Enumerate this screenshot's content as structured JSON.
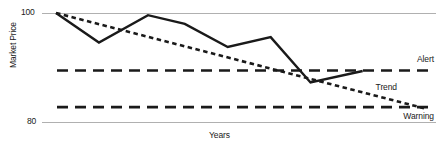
{
  "chart_data": {
    "type": "line",
    "title": "",
    "xlabel": "Years",
    "ylabel": "Market Price",
    "ylim": [
      80,
      100
    ],
    "xlim": [
      0,
      12
    ],
    "yticks": [
      80,
      100
    ],
    "ytick_labels": [
      "80",
      "100"
    ],
    "grid": "horizontal-baselines-only",
    "legend": "inline-right-labels",
    "series": [
      {
        "name": "Market Price",
        "style": "solid",
        "color": "#1a1a1a",
        "x": [
          0,
          1.4,
          3.0,
          4.2,
          5.6,
          7.0,
          8.3,
          10.0
        ],
        "values": [
          100.0,
          94.6,
          99.6,
          98.0,
          93.8,
          95.6,
          87.3,
          89.4
        ]
      },
      {
        "name": "Trend",
        "style": "dotted",
        "color": "#1a1a1a",
        "x": [
          0,
          12
        ],
        "values": [
          100.0,
          82.6
        ]
      },
      {
        "name": "Alert",
        "style": "dashed",
        "color": "#1a1a1a",
        "type": "horizontal-threshold",
        "value": 89.5
      },
      {
        "name": "Warning",
        "style": "dashed",
        "color": "#1a1a1a",
        "type": "horizontal-threshold",
        "value": 82.8
      }
    ],
    "annotations": [
      {
        "text": "Alert",
        "series": "Alert",
        "position": "right-above"
      },
      {
        "text": "Trend",
        "series": "Trend",
        "position": "right-above"
      },
      {
        "text": "Warning",
        "series": "Warning",
        "position": "right-below"
      }
    ]
  },
  "axes": {
    "ylabel": "Market Price",
    "xlabel": "Years",
    "tick_top": "100",
    "tick_bottom": "80"
  },
  "labels": {
    "alert": "Alert",
    "trend": "Trend",
    "warning": "Warning"
  },
  "colors": {
    "ink": "#1a1a1a",
    "gridline": "#b8b8b8",
    "background": "#ffffff"
  }
}
